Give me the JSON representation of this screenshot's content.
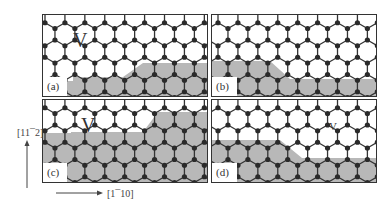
{
  "figure": {
    "panels": [
      {
        "id": "a",
        "label": "(a)",
        "vacancy_label": "V",
        "vacancy_pos": [
          30,
          20
        ],
        "vacancy_size": 18
      },
      {
        "id": "b",
        "label": "(b)",
        "vacancy_label": "",
        "vacancy_pos": [
          0,
          0
        ],
        "vacancy_size": 0
      },
      {
        "id": "c",
        "label": "(c)",
        "vacancy_label": "V",
        "vacancy_pos": [
          38,
          20
        ],
        "vacancy_size": 18
      },
      {
        "id": "d",
        "label": "(d)",
        "vacancy_label": "V",
        "vacancy_pos": [
          118,
          22
        ],
        "vacancy_size": 10
      }
    ],
    "axes": {
      "vertical": "[11¯2]",
      "horizontal": "[1¯10]"
    },
    "colors": {
      "atom": "#2a2a2a",
      "bond": "#333333",
      "shade": "#b8b8b8",
      "frame": "#333333"
    }
  }
}
